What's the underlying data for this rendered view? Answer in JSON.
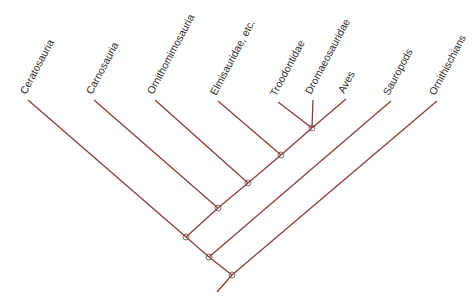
{
  "diagram": {
    "type": "cladogram",
    "colors": {
      "branch": "#8b3c3c",
      "node_outline": "#6e5a5a",
      "label": "#2a2a2a",
      "background": "#ffffff"
    },
    "taxa": [
      {
        "id": "ceratosauria",
        "label": "Ceratosauria"
      },
      {
        "id": "carnosauria",
        "label": "Carnosauria"
      },
      {
        "id": "ornithomimosauria",
        "label": "Ornithomimosauria"
      },
      {
        "id": "elmisauridae",
        "label": "Elmisauridae, etc."
      },
      {
        "id": "troodontidae",
        "label": "Troodontidae"
      },
      {
        "id": "dromaeosauridae",
        "label": "Dromaeosauridae"
      },
      {
        "id": "aves",
        "label": "Aves"
      },
      {
        "id": "sauropods",
        "label": "Sauropods"
      },
      {
        "id": "ornithischians",
        "label": "Ornithischians"
      }
    ],
    "tree": "(((Ceratosauria,(Carnosauria,(Ornithomimosauria,(Elmisauridae, etc.,(Troodontidae,Dromaeosauridae,Aves)))))),Sauropods),Ornithischians)"
  }
}
